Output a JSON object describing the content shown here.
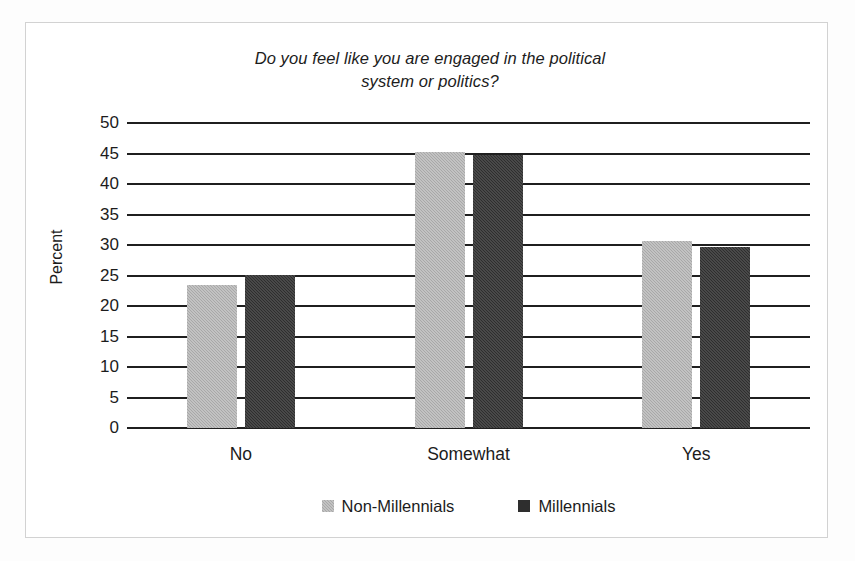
{
  "chart_data": {
    "type": "bar",
    "title": "Do you feel like you are engaged in the political system or politics?",
    "title_line1": "Do you feel like you are engaged in the political",
    "title_line2": "system or politics?",
    "xlabel": "",
    "ylabel": "Percent",
    "categories": [
      "No",
      "Somewhat",
      "Yes"
    ],
    "series": [
      {
        "name": "Non-Millennials",
        "color": "#a8a8a8",
        "values": [
          23.5,
          45.2,
          30.7
        ]
      },
      {
        "name": "Millennials",
        "color": "#2e2e2e",
        "values": [
          25.1,
          44.7,
          29.6
        ]
      }
    ],
    "ylim": [
      0,
      50
    ],
    "ytick_step": 5,
    "yticks": [
      "50",
      "45",
      "40",
      "35",
      "30",
      "25",
      "20",
      "15",
      "10",
      "5",
      "0"
    ],
    "grid": "horizontal",
    "legend_position": "bottom-center",
    "gridline_color": "#1f1f1f",
    "background_color": "#ffffff",
    "border_color": "#d2d2d2"
  }
}
